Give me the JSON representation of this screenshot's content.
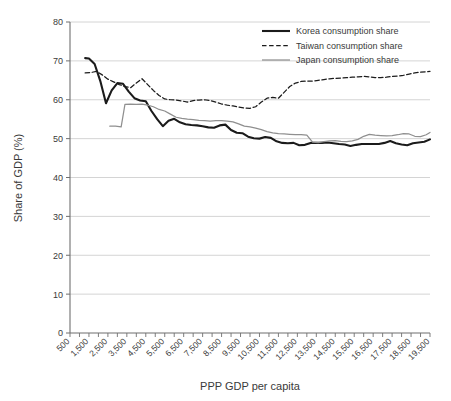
{
  "chart_data": {
    "type": "line",
    "title": "",
    "xlabel": "PPP GDP per capita",
    "ylabel": "Share of GDP (%)",
    "xlim": [
      500,
      19500
    ],
    "ylim": [
      0,
      80
    ],
    "yticks": [
      0,
      10,
      20,
      30,
      40,
      50,
      60,
      70,
      80
    ],
    "ytick_labels": [
      "0",
      "10",
      "20",
      "30",
      "40",
      "50",
      "60",
      "70",
      "80"
    ],
    "grid": "horizontal",
    "legend_position": "top-right",
    "x": [
      500,
      1000,
      1500,
      2000,
      2500,
      3000,
      3500,
      4000,
      4500,
      5000,
      5500,
      6000,
      6500,
      7000,
      7500,
      8000,
      8500,
      9000,
      9500,
      10000,
      10500,
      11000,
      11500,
      12000,
      12500,
      13000,
      13500,
      14000,
      14500,
      15000,
      15500,
      16000,
      16500,
      17000,
      17500,
      18000,
      18500,
      19000,
      19500
    ],
    "xtick_labels": [
      "500",
      "1,500",
      "2,500",
      "3,500",
      "4,500",
      "5,500",
      "6,500",
      "7,500",
      "8,500",
      "9,500",
      "10,500",
      "11,500",
      "12,500",
      "13,500",
      "14,500",
      "15,500",
      "16,500",
      "17,500",
      "18,500",
      "19,500"
    ],
    "xtick_values": [
      500,
      1500,
      2500,
      3500,
      4500,
      5500,
      6500,
      7500,
      8500,
      9500,
      10500,
      11500,
      12500,
      13500,
      14500,
      15500,
      16500,
      17500,
      18500,
      19500
    ],
    "series": [
      {
        "name": "Korea consumption share",
        "style": "solid",
        "color": "#1b1b1b",
        "width": 2.1,
        "x": [
          1300,
          1500,
          1800,
          2100,
          2400,
          2700,
          3000,
          3300,
          3600,
          3900,
          4200,
          4500,
          4800,
          5100,
          5400,
          5700,
          6000,
          6300,
          6600,
          6900,
          7200,
          7500,
          7800,
          8100,
          8400,
          8700,
          9000,
          9300,
          9600,
          9900,
          10200,
          10500,
          10800,
          11100,
          11400,
          11700,
          12000,
          12300,
          12600,
          12900,
          13200,
          13500,
          13800,
          14100,
          14400,
          14700,
          15000,
          15300,
          15600,
          15900,
          16200,
          16500,
          16800,
          17100,
          17400,
          17700,
          18000,
          18300,
          18600,
          18900,
          19200,
          19500
        ],
        "values": [
          70.7,
          70.6,
          69.2,
          64.8,
          59.1,
          62.4,
          64.3,
          64.1,
          62.1,
          60.4,
          59.8,
          59.6,
          57.1,
          55.0,
          53.2,
          54.6,
          55.1,
          54.2,
          53.7,
          53.5,
          53.4,
          53.2,
          52.9,
          52.8,
          53.4,
          53.6,
          52.2,
          51.5,
          51.4,
          50.5,
          50.1,
          50.0,
          50.4,
          50.2,
          49.3,
          48.9,
          48.8,
          48.9,
          48.3,
          48.4,
          48.9,
          48.9,
          48.9,
          49.0,
          48.8,
          48.6,
          48.5,
          48.1,
          48.4,
          48.6,
          48.6,
          48.6,
          48.6,
          48.9,
          49.4,
          48.8,
          48.5,
          48.3,
          48.8,
          49.0,
          49.2,
          49.8
        ]
      },
      {
        "name": "Taiwan consumption share",
        "style": "dashed",
        "color": "#1b1b1b",
        "width": 1.25,
        "x": [
          1300,
          1600,
          1900,
          2200,
          2500,
          2800,
          3100,
          3400,
          3700,
          4000,
          4300,
          4600,
          4900,
          5200,
          5500,
          5800,
          6100,
          6400,
          6700,
          7000,
          7300,
          7600,
          7900,
          8200,
          8500,
          8800,
          9100,
          9400,
          9700,
          10000,
          10300,
          10600,
          10900,
          11200,
          11500,
          11800,
          12100,
          12400,
          12700,
          13000,
          13300,
          13600,
          13900,
          14200,
          14500,
          14800,
          15100,
          15400,
          15700,
          16000,
          16300,
          16600,
          16900,
          17200,
          17500,
          17800,
          18100,
          18400,
          18700,
          19000,
          19300,
          19500
        ],
        "values": [
          66.9,
          67.0,
          67.3,
          66.4,
          65.3,
          64.6,
          63.9,
          63.4,
          63.1,
          64.3,
          65.4,
          63.9,
          62.4,
          61.1,
          60.2,
          60.0,
          59.9,
          59.7,
          59.4,
          59.8,
          59.9,
          60.0,
          59.8,
          59.4,
          58.9,
          58.6,
          58.4,
          58.1,
          57.9,
          57.8,
          58.2,
          59.4,
          60.4,
          60.6,
          60.4,
          61.9,
          63.4,
          64.3,
          64.7,
          64.8,
          64.8,
          65.0,
          65.2,
          65.4,
          65.5,
          65.6,
          65.7,
          65.8,
          65.9,
          66.0,
          65.9,
          65.7,
          65.7,
          65.8,
          66.0,
          66.1,
          66.3,
          66.6,
          66.9,
          67.1,
          67.2,
          67.3
        ]
      },
      {
        "name": "Japan consumption share",
        "style": "solid",
        "color": "#8f8f8f",
        "width": 1.25,
        "x": [
          2600,
          2900,
          3200,
          3400,
          3700,
          4000,
          4300,
          4600,
          4900,
          5200,
          5500,
          5800,
          6100,
          6400,
          6700,
          7000,
          7300,
          7600,
          7900,
          8200,
          8500,
          8800,
          9100,
          9400,
          9700,
          10000,
          10300,
          10600,
          10900,
          11200,
          11500,
          11800,
          12100,
          12400,
          12700,
          13000,
          13300,
          13600,
          13900,
          14200,
          14500,
          14800,
          15100,
          15400,
          15700,
          16000,
          16300,
          16600,
          16900,
          17200,
          17500,
          17800,
          18100,
          18400,
          18700,
          19000,
          19300,
          19500
        ],
        "values": [
          53.2,
          53.2,
          53.0,
          58.8,
          58.9,
          58.8,
          58.9,
          58.6,
          58.2,
          57.5,
          57.1,
          56.3,
          55.5,
          55.2,
          55.0,
          54.9,
          54.7,
          54.6,
          54.5,
          54.6,
          54.6,
          54.5,
          54.3,
          53.8,
          53.2,
          53.0,
          52.7,
          52.3,
          51.8,
          51.5,
          51.3,
          51.2,
          51.1,
          51.0,
          51.0,
          50.9,
          49.1,
          49.0,
          49.2,
          49.4,
          49.5,
          49.3,
          49.2,
          49.4,
          49.8,
          50.6,
          51.1,
          50.9,
          50.8,
          50.7,
          50.8,
          51.0,
          51.3,
          51.2,
          50.6,
          50.5,
          51.0,
          51.6
        ]
      }
    ]
  },
  "legend": {
    "items": [
      {
        "label": "Korea consumption share",
        "style": "solid-thick",
        "color": "#1b1b1b"
      },
      {
        "label": "Taiwan consumption share",
        "style": "dashed",
        "color": "#1b1b1b"
      },
      {
        "label": "Japan consumption share",
        "style": "solid-thin",
        "color": "#8f8f8f"
      }
    ]
  }
}
